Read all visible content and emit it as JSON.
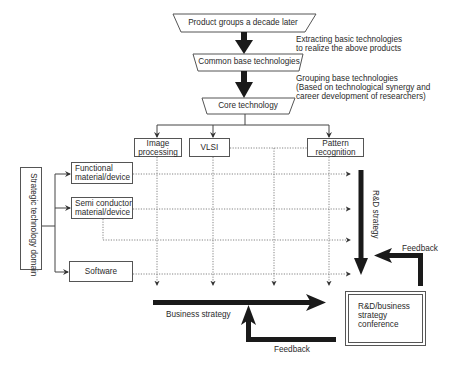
{
  "hierarchy": {
    "product_groups": "Product groups a decade later",
    "common_base": "Common base technologies",
    "core": "Core technology",
    "step1_note": [
      "Extracting basic technologies",
      "to realize the above products"
    ],
    "step2_note": [
      "Grouping base technologies",
      "(Based on technological synergy and",
      "career development of researchers)"
    ]
  },
  "core_areas": [
    {
      "line1": "Image",
      "line2": "processing"
    },
    {
      "line1": "VLSI",
      "line2": ""
    },
    {
      "line1": "Pattern",
      "line2": "recognition"
    }
  ],
  "domain": {
    "title": "Strategic technology domain",
    "items": [
      {
        "line1": "Functional",
        "line2": "material/device"
      },
      {
        "line1": "Semi conductor",
        "line2": "material/device"
      },
      {
        "line1": "Software",
        "line2": ""
      }
    ]
  },
  "flows": {
    "rd_strategy": "R&D strategy",
    "business_strategy": "Business strategy",
    "feedback_right": "Feedback",
    "feedback_bottom": "Feedback"
  },
  "conference": [
    "R&D/business",
    "strategy",
    "conference"
  ],
  "colors": {
    "line": "#444444",
    "arrow": "#1a1a1a",
    "dotted": "#777777"
  }
}
